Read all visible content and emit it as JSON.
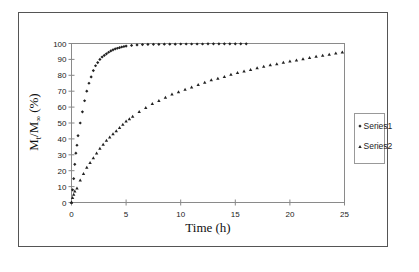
{
  "chart_data": {
    "type": "scatter",
    "title": "",
    "xlabel": "Time (h)",
    "ylabel": "Mt/M∞ (%)",
    "ylabel_parts": {
      "main1": "M",
      "sub1": "t",
      "main2": "/M",
      "sub2": "∞",
      "rest": " (%)"
    },
    "xlim": [
      0,
      25
    ],
    "ylim": [
      0,
      100
    ],
    "x_ticks": [
      0,
      5,
      10,
      15,
      20,
      25
    ],
    "y_ticks": [
      0,
      10,
      20,
      30,
      40,
      50,
      60,
      70,
      80,
      90,
      100
    ],
    "grid": false,
    "legend_position": "right",
    "series": [
      {
        "name": "Series1",
        "marker": "diamond",
        "x": [
          0,
          0.1,
          0.2,
          0.3,
          0.4,
          0.5,
          0.6,
          0.8,
          1.0,
          1.2,
          1.4,
          1.6,
          1.8,
          2.0,
          2.2,
          2.4,
          2.6,
          2.8,
          3.0,
          3.2,
          3.4,
          3.6,
          3.8,
          4.0,
          4.2,
          4.4,
          4.6,
          4.8,
          5.0,
          5.5,
          6.0,
          6.5,
          7.0,
          7.5,
          8.0,
          8.5,
          9.0,
          9.5,
          10.0,
          10.5,
          11.0,
          11.5,
          12.0,
          12.5,
          13.0,
          13.5,
          14.0,
          14.5,
          15.0,
          15.5,
          16.0
        ],
        "y": [
          0,
          8,
          15,
          24,
          31,
          36,
          42,
          50,
          57,
          64,
          70,
          75,
          79,
          83,
          86,
          88,
          90,
          91.5,
          92.5,
          93.5,
          94.5,
          95.3,
          96,
          96.6,
          97,
          97.4,
          97.8,
          98.1,
          98.4,
          98.8,
          99.1,
          99.3,
          99.4,
          99.5,
          99.5,
          99.6,
          99.6,
          99.6,
          99.7,
          99.7,
          99.7,
          99.7,
          99.7,
          99.8,
          99.8,
          99.8,
          99.8,
          99.8,
          99.8,
          99.8,
          99.8
        ]
      },
      {
        "name": "Series2",
        "marker": "triangle",
        "x": [
          0,
          0.1,
          0.2,
          0.3,
          0.5,
          0.8,
          1.1,
          1.4,
          1.7,
          2.0,
          2.3,
          2.6,
          2.9,
          3.2,
          3.5,
          3.8,
          4.1,
          4.4,
          4.7,
          5.0,
          5.3,
          5.6,
          6.2,
          6.8,
          7.4,
          8.0,
          8.6,
          9.2,
          9.8,
          10.4,
          11.0,
          11.6,
          12.2,
          12.8,
          13.4,
          14.0,
          14.6,
          15.2,
          15.8,
          16.4,
          17.0,
          17.6,
          18.2,
          18.8,
          19.4,
          20.0,
          20.6,
          21.2,
          21.8,
          22.4,
          23.0,
          23.6,
          24.2,
          24.8
        ],
        "y": [
          0,
          3,
          5,
          7,
          9,
          14,
          18,
          22,
          25,
          28,
          31,
          34,
          36.5,
          39,
          41,
          43,
          45,
          47,
          49,
          51,
          52.5,
          54,
          57,
          59.5,
          62,
          64,
          66,
          68,
          69.5,
          71,
          72.5,
          74,
          75.5,
          77,
          78,
          79,
          80.5,
          81.5,
          82.5,
          83.5,
          84.5,
          85.5,
          86.5,
          87,
          88,
          88.8,
          89.5,
          90.2,
          91,
          91.8,
          92.5,
          93,
          93.8,
          94.5
        ]
      }
    ]
  }
}
